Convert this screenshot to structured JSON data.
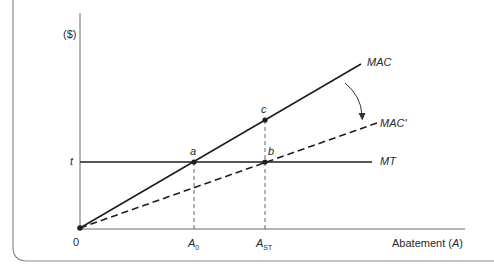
{
  "diagram": {
    "y_axis_label": "($)",
    "x_axis_label_text": "Abatement (",
    "x_axis_label_var": "A",
    "x_axis_label_close": ")",
    "origin_label": "0",
    "tax_label": "t",
    "curves": {
      "mac": "MAC",
      "mac_prime": "MAC'",
      "mt": "MT"
    },
    "points": {
      "a": "a",
      "b": "b",
      "c": "c"
    },
    "x_ticks": {
      "a0_main": "A",
      "a0_sub": "0",
      "ast_main": "A",
      "ast_sub": "ST"
    },
    "colors": {
      "line": "#1e1e1e",
      "frame": "#8a8a8a",
      "axis": "#6a6a6a",
      "text": "#2a2a2a"
    }
  }
}
